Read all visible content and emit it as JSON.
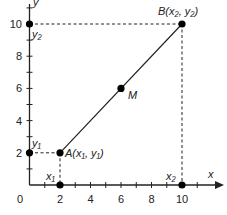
{
  "diagram": {
    "axes": {
      "x_label": "x",
      "y_label": "y",
      "origin_label": "0",
      "x_ticks": [
        "2",
        "4",
        "6",
        "8",
        "10"
      ],
      "y_ticks": [
        "2",
        "4",
        "6",
        "8",
        "10"
      ]
    },
    "points": {
      "A": {
        "label": "A(x₁, y₁)",
        "x": 2,
        "y": 2
      },
      "B": {
        "label": "B(x₂, y₂)",
        "x": 10,
        "y": 10
      },
      "M": {
        "label": "M",
        "x": 6,
        "y": 6
      }
    },
    "axis_markers": {
      "x1": "x₁",
      "x2": "x₂",
      "y1": "y₁",
      "y2": "y₂"
    },
    "colors": {
      "line": "#222222",
      "point": "#000000"
    }
  }
}
